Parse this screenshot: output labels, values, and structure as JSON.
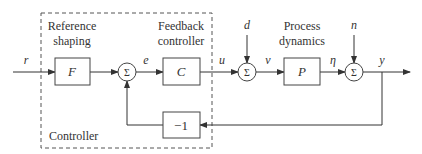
{
  "diagram": {
    "controller_label": "Controller",
    "reference_shaping_line1": "Reference",
    "reference_shaping_line2": "shaping",
    "feedback_controller_line1": "Feedback",
    "feedback_controller_line2": "controller",
    "process_dynamics_line1": "Process",
    "process_dynamics_line2": "dynamics",
    "blocks": {
      "F": "F",
      "C": "C",
      "P": "P",
      "neg": "−1"
    },
    "sum_symbol": "Σ",
    "signals": {
      "r": "r",
      "e": "e",
      "u": "u",
      "d": "d",
      "v": "ν",
      "eta": "η",
      "n": "n",
      "y": "y"
    }
  }
}
